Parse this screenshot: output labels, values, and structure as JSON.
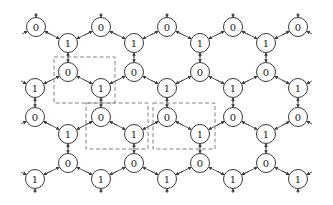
{
  "diagram": {
    "type": "honeycomb-lattice",
    "node_radius": 9.5,
    "colors": {
      "edge": "#4a4a4a",
      "node_stroke": "#3a3a3a",
      "dash": "#777777",
      "text": "#222222"
    },
    "rows": [
      {
        "name": "row-a",
        "y": 27,
        "label": "0",
        "xs": [
          36,
          101,
          167,
          233,
          298
        ]
      },
      {
        "name": "row-b",
        "y": 43,
        "label": "1",
        "xs": [
          68,
          134,
          200,
          266
        ]
      },
      {
        "name": "row-c",
        "y": 72,
        "label": "0",
        "xs": [
          68,
          134,
          200,
          266
        ]
      },
      {
        "name": "row-d",
        "y": 88,
        "label": "1",
        "xs": [
          35,
          101,
          167,
          233,
          298
        ]
      },
      {
        "name": "row-e",
        "y": 117,
        "label": "0",
        "xs": [
          35,
          101,
          167,
          233,
          298
        ]
      },
      {
        "name": "row-f",
        "y": 134,
        "label": "1",
        "xs": [
          68,
          134,
          200,
          266
        ]
      },
      {
        "name": "row-g",
        "y": 163,
        "label": "0",
        "xs": [
          68,
          134,
          200,
          266
        ]
      },
      {
        "name": "row-h",
        "y": 179,
        "label": "1",
        "xs": [
          35,
          101,
          167,
          233,
          298
        ]
      }
    ],
    "dashed_boxes": [
      {
        "x": 54,
        "y": 57,
        "w": 61,
        "h": 46
      },
      {
        "x": 86,
        "y": 103,
        "w": 62,
        "h": 46
      },
      {
        "x": 153,
        "y": 103,
        "w": 62,
        "h": 46
      }
    ]
  }
}
